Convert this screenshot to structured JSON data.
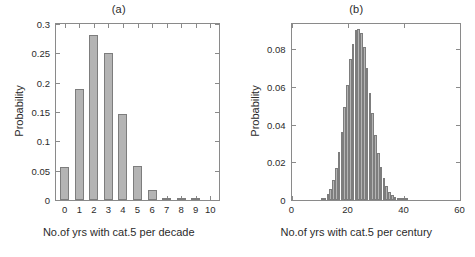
{
  "figure": {
    "panels": [
      {
        "key": "a",
        "title": "(a)",
        "xlabel": "No.of yrs with cat.5 per decade",
        "ylabel": "Probability"
      },
      {
        "key": "b",
        "title": "(b)",
        "xlabel": "No.of yrs with cat.5 per century",
        "ylabel": "Probability"
      }
    ]
  },
  "chart_data": [
    {
      "type": "bar",
      "title": "(a)",
      "xlabel": "No.of yrs with cat.5 per decade",
      "ylabel": "Probability",
      "categories": [
        "0",
        "1",
        "2",
        "3",
        "4",
        "5",
        "6",
        "7",
        "8",
        "9",
        "10"
      ],
      "x": [
        0,
        1,
        2,
        3,
        4,
        5,
        6,
        7,
        8,
        9,
        10
      ],
      "values": [
        0.056,
        0.189,
        0.282,
        0.25,
        0.146,
        0.058,
        0.017,
        0.0035,
        0.0008,
        0.0001,
        0.0
      ],
      "xlim": [
        -0.6,
        10.6
      ],
      "ylim": [
        0,
        0.3
      ],
      "xticks": [
        0,
        1,
        2,
        3,
        4,
        5,
        6,
        7,
        8,
        9,
        10
      ],
      "yticks": [
        0,
        0.05,
        0.1,
        0.15,
        0.2,
        0.25,
        0.3
      ],
      "ytick_labels": [
        "0",
        "0.05",
        "0.1",
        "0.15",
        "0.2",
        "0.25",
        "0.3"
      ],
      "grid": false,
      "legend": "none",
      "bar_color": "#b4b4b4",
      "bar_edge_color": "#7d7d7d"
    },
    {
      "type": "bar",
      "title": "(b)",
      "xlabel": "No.of yrs with cat.5 per century",
      "ylabel": "Probability",
      "x": [
        11,
        12,
        13,
        14,
        15,
        16,
        17,
        18,
        19,
        20,
        21,
        22,
        23,
        24,
        25,
        26,
        27,
        28,
        29,
        30,
        31,
        32,
        33,
        34,
        35,
        36,
        37,
        38,
        39,
        40,
        41
      ],
      "values": [
        0.0005,
        0.0012,
        0.003,
        0.006,
        0.0105,
        0.017,
        0.0255,
        0.036,
        0.0495,
        0.061,
        0.075,
        0.083,
        0.0905,
        0.091,
        0.0885,
        0.0815,
        0.07,
        0.057,
        0.046,
        0.0345,
        0.025,
        0.0175,
        0.0115,
        0.0075,
        0.0045,
        0.0025,
        0.0014,
        0.0008,
        0.0004,
        0.0002,
        0.0001
      ],
      "xlim": [
        0,
        60
      ],
      "ylim": [
        0,
        0.0935
      ],
      "xticks": [
        0,
        20,
        40,
        60
      ],
      "xtick_labels": [
        "0",
        "20",
        "40",
        "60"
      ],
      "yticks": [
        0,
        0.02,
        0.04,
        0.06,
        0.08
      ],
      "ytick_labels": [
        "0",
        "0.02",
        "0.04",
        "0.06",
        "0.08"
      ],
      "grid": false,
      "legend": "none",
      "bar_color": "#b4b4b4",
      "bar_edge_color": "#7d7d7d"
    }
  ]
}
